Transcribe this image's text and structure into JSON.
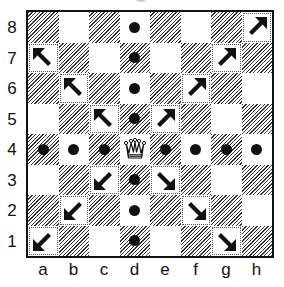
{
  "diagram": {
    "type": "chessboard",
    "piece": {
      "name": "queen",
      "color": "white",
      "square": "d4"
    },
    "ranks": [
      "8",
      "7",
      "6",
      "5",
      "4",
      "3",
      "2",
      "1"
    ],
    "files": [
      "a",
      "b",
      "c",
      "d",
      "e",
      "f",
      "g",
      "h"
    ],
    "dots": [
      "d8",
      "d7",
      "d6",
      "d5",
      "d3",
      "d2",
      "d1",
      "a4",
      "b4",
      "c4",
      "e4",
      "f4",
      "g4",
      "h4"
    ],
    "arrows": [
      {
        "square": "a7",
        "direction": "NW"
      },
      {
        "square": "b6",
        "direction": "NW"
      },
      {
        "square": "c5",
        "direction": "NW"
      },
      {
        "square": "e5",
        "direction": "NE"
      },
      {
        "square": "f6",
        "direction": "NE"
      },
      {
        "square": "g7",
        "direction": "NE"
      },
      {
        "square": "h8",
        "direction": "NE"
      },
      {
        "square": "c3",
        "direction": "SW"
      },
      {
        "square": "b2",
        "direction": "SW"
      },
      {
        "square": "a1",
        "direction": "SW"
      },
      {
        "square": "e3",
        "direction": "SE"
      },
      {
        "square": "f2",
        "direction": "SE"
      },
      {
        "square": "g1",
        "direction": "SE"
      }
    ],
    "colors": {
      "ink": "#111111",
      "light": "#ffffff",
      "hatch": "#333333"
    }
  }
}
